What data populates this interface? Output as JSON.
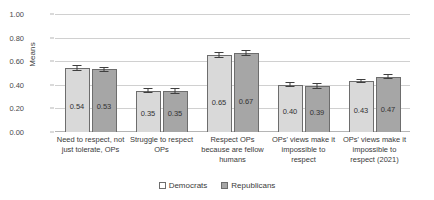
{
  "chart_data": {
    "type": "bar",
    "title": "",
    "xlabel": "",
    "ylabel": "Means",
    "ylim": [
      0,
      1
    ],
    "yticks": [
      "0.00",
      "0.20",
      "0.40",
      "0.60",
      "0.80",
      "1.00"
    ],
    "grid": true,
    "legend_position": "bottom",
    "categories": [
      "Need to respect, not just tolerate, OPs",
      "Struggle to respect OPs",
      "Respect OPs because are fellow humans",
      "OPs' views make it impossible to respect",
      "OPs' views make it impossible to respect (2021)"
    ],
    "series": [
      {
        "name": "Democrats",
        "color": "#d9d9d9",
        "values": [
          0.54,
          0.35,
          0.65,
          0.4,
          0.43
        ],
        "value_labels": [
          "0.54",
          "0.35",
          "0.65",
          "0.40",
          "0.43"
        ],
        "errors": [
          0.025,
          0.022,
          0.025,
          0.022,
          0.018
        ]
      },
      {
        "name": "Republicans",
        "color": "#a6a6a6",
        "values": [
          0.53,
          0.35,
          0.67,
          0.39,
          0.47
        ],
        "value_labels": [
          "0.53",
          "0.35",
          "0.67",
          "0.39",
          "0.47"
        ],
        "errors": [
          0.025,
          0.025,
          0.022,
          0.022,
          0.02
        ]
      }
    ]
  },
  "legend": {
    "items": [
      {
        "label": "Democrats"
      },
      {
        "label": "Republicans"
      }
    ]
  }
}
